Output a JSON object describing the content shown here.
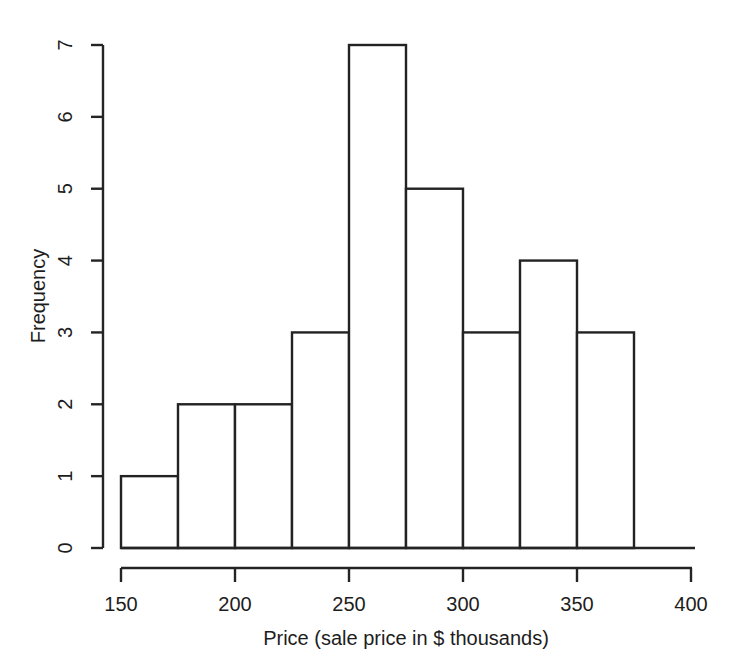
{
  "chart_data": {
    "type": "bar",
    "title": "",
    "subtitle": "",
    "xlabel": "Price (sale price in $ thousands)",
    "ylabel": "Frequency",
    "xlim": [
      150,
      400
    ],
    "ylim": [
      0,
      7
    ],
    "grid": false,
    "legend": null,
    "bin_width": 25,
    "bin_edges": [
      150,
      175,
      200,
      225,
      250,
      275,
      300,
      325,
      350,
      375
    ],
    "categories": [
      "150-175",
      "175-200",
      "200-225",
      "225-250",
      "250-275",
      "275-300",
      "300-325",
      "325-350",
      "350-375"
    ],
    "values": [
      1,
      2,
      2,
      3,
      7,
      5,
      3,
      4,
      3
    ],
    "bars": [
      {
        "label": "150-175",
        "x0": 150,
        "x1": 175,
        "value": 1
      },
      {
        "label": "175-200",
        "x0": 175,
        "x1": 200,
        "value": 2
      },
      {
        "label": "200-225",
        "x0": 200,
        "x1": 225,
        "value": 2
      },
      {
        "label": "225-250",
        "x0": 225,
        "x1": 250,
        "value": 3
      },
      {
        "label": "250-275",
        "x0": 250,
        "x1": 275,
        "value": 7
      },
      {
        "label": "275-300",
        "x0": 275,
        "x1": 300,
        "value": 5
      },
      {
        "label": "300-325",
        "x0": 300,
        "x1": 325,
        "value": 3
      },
      {
        "label": "325-350",
        "x0": 325,
        "x1": 350,
        "value": 4
      },
      {
        "label": "350-375",
        "x0": 350,
        "x1": 375,
        "value": 3
      }
    ],
    "xticks": [
      150,
      200,
      250,
      300,
      350,
      400
    ],
    "xtick_labels": [
      "150",
      "200",
      "250",
      "300",
      "350",
      "400"
    ],
    "yticks": [
      0,
      1,
      2,
      3,
      4,
      5,
      6,
      7
    ],
    "ytick_labels": [
      "0",
      "1",
      "2",
      "3",
      "4",
      "5",
      "6",
      "7"
    ],
    "total_count": 30
  },
  "axes": {
    "y": {
      "title": "Frequency",
      "ticks": [
        {
          "value": 0,
          "label": "0"
        },
        {
          "value": 1,
          "label": "1"
        },
        {
          "value": 2,
          "label": "2"
        },
        {
          "value": 3,
          "label": "3"
        },
        {
          "value": 4,
          "label": "4"
        },
        {
          "value": 5,
          "label": "5"
        },
        {
          "value": 6,
          "label": "6"
        },
        {
          "value": 7,
          "label": "7"
        }
      ]
    },
    "x": {
      "title": "Price (sale price in $ thousands)",
      "ticks": [
        {
          "value": 150,
          "label": "150"
        },
        {
          "value": 200,
          "label": "200"
        },
        {
          "value": 250,
          "label": "250"
        },
        {
          "value": 300,
          "label": "300"
        },
        {
          "value": 350,
          "label": "350"
        },
        {
          "value": 400,
          "label": "400"
        }
      ]
    }
  },
  "colors": {
    "background": "#ffffff",
    "ink": "#242424",
    "bar_fill": "#ffffff",
    "bar_stroke": "#222222"
  }
}
